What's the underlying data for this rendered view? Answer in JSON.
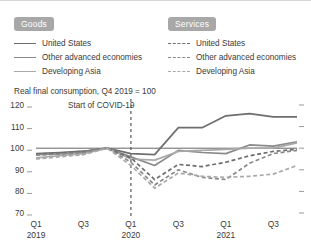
{
  "figure": {
    "title": "Real final consumption, Q4 2019 = 100",
    "annotation": "Start of COVID-19"
  },
  "legend": {
    "goods": {
      "badge": "Goods",
      "items": [
        {
          "label": "United States",
          "style": "solid",
          "color": "#6e6e6e"
        },
        {
          "label": "Other advanced economies",
          "style": "solid",
          "color": "#8a8a8a"
        },
        {
          "label": "Developing Asia",
          "style": "solid",
          "color": "#a9a9a9"
        }
      ]
    },
    "services": {
      "badge": "Services",
      "items": [
        {
          "label": "United States",
          "style": "dashed",
          "color": "#6e6e6e"
        },
        {
          "label": "Other advanced economies",
          "style": "dashed",
          "color": "#8a8a8a"
        },
        {
          "label": "Developing Asia",
          "style": "dashed",
          "color": "#a9a9a9"
        }
      ]
    }
  },
  "chart_data": {
    "type": "line",
    "title": "Real final consumption, Q4 2019 = 100",
    "xlabel": "",
    "ylabel": "",
    "ylim": [
      70,
      120
    ],
    "yticks": [
      120,
      110,
      100,
      90,
      80,
      70
    ],
    "grid": false,
    "legend_position": "top",
    "annotations": [
      {
        "text": "Start of COVID-19",
        "x": "Q1 2020",
        "type": "vertical-dashed-line"
      }
    ],
    "x": [
      "Q1 2019",
      "Q2 2019",
      "Q3 2019",
      "Q4 2019",
      "Q1 2020",
      "Q2 2020",
      "Q3 2020",
      "Q4 2020",
      "Q1 2021",
      "Q2 2021",
      "Q3 2021",
      "Q4 2021"
    ],
    "xtick_labels": [
      "Q1",
      "Q3",
      "Q1",
      "Q3",
      "Q1",
      "Q3"
    ],
    "xtick_years": [
      "2019",
      "",
      "2020",
      "",
      "2021",
      ""
    ],
    "xtick_positions": [
      "Q1 2019",
      "Q3 2019",
      "Q1 2020",
      "Q3 2020",
      "Q1 2021",
      "Q3 2021"
    ],
    "series": [
      {
        "name": "United States — Goods",
        "group": "Goods",
        "style": "solid",
        "color": "#6e6e6e",
        "values": [
          97.5,
          98.0,
          98.6,
          100.0,
          97.5,
          97.0,
          109.5,
          109.5,
          115.0,
          116.0,
          114.5,
          114.5
        ]
      },
      {
        "name": "Other advanced economies — Goods",
        "group": "Goods",
        "style": "solid",
        "color": "#8a8a8a",
        "values": [
          97.0,
          97.4,
          98.2,
          100.0,
          96.0,
          92.0,
          99.0,
          98.0,
          97.5,
          101.5,
          101.0,
          103.0
        ]
      },
      {
        "name": "Developing Asia — Goods",
        "group": "Goods",
        "style": "solid",
        "color": "#a9a9a9",
        "values": [
          95.5,
          96.5,
          97.5,
          100.0,
          95.0,
          94.5,
          98.5,
          99.0,
          99.5,
          100.0,
          100.0,
          102.5
        ]
      },
      {
        "name": "United States — Services",
        "group": "Services",
        "style": "dashed",
        "color": "#6e6e6e",
        "values": [
          97.2,
          97.8,
          98.5,
          100.0,
          95.5,
          85.5,
          92.5,
          91.5,
          93.5,
          96.5,
          98.5,
          99.5
        ]
      },
      {
        "name": "Other advanced economies — Services",
        "group": "Services",
        "style": "dashed",
        "color": "#8a8a8a",
        "values": [
          96.8,
          97.2,
          98.0,
          100.0,
          93.5,
          83.0,
          90.0,
          86.5,
          85.5,
          93.0,
          97.5,
          99.0
        ]
      },
      {
        "name": "Developing Asia — Services",
        "group": "Services",
        "style": "dashed",
        "color": "#a9a9a9",
        "values": [
          95.0,
          96.0,
          97.0,
          100.0,
          92.0,
          81.5,
          88.5,
          87.0,
          86.5,
          87.0,
          88.0,
          92.0
        ]
      }
    ]
  }
}
